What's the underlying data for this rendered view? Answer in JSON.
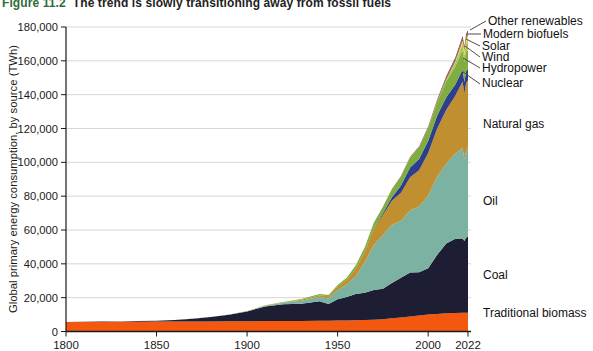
{
  "title": {
    "figure_label": "Figure 11.2",
    "figure_label_color": "#2F6B38",
    "text": "The trend is slowly transitioning away from fossil fuels"
  },
  "axes": {
    "y_label": "Global primary energy consumption, by source (TWh)",
    "y_ticks": [
      "0",
      "20,000",
      "40,000",
      "60,000",
      "80,000",
      "100,000",
      "120,000",
      "140,000",
      "160,000",
      "180,000"
    ],
    "x_ticks": [
      "1800",
      "1850",
      "1900",
      "1950",
      "2000",
      "2022"
    ]
  },
  "chart_data": {
    "type": "area",
    "stacked": true,
    "title": "",
    "xlabel": "",
    "ylabel": "Global primary energy consumption, by source (TWh)",
    "xlim": [
      1800,
      2022
    ],
    "ylim": [
      0,
      180000
    ],
    "grid": true,
    "legend_position": "right-direct-labels",
    "grid_color": "#d6d6d6",
    "axis_color": "#1a1a1a",
    "label_color": "#111111",
    "leader_color": "#4d4d4d",
    "x": [
      1800,
      1810,
      1820,
      1830,
      1840,
      1850,
      1860,
      1870,
      1880,
      1890,
      1900,
      1910,
      1920,
      1930,
      1940,
      1945,
      1950,
      1955,
      1960,
      1965,
      1970,
      1975,
      1980,
      1985,
      1990,
      1995,
      2000,
      2005,
      2010,
      2015,
      2019,
      2020,
      2021,
      2022
    ],
    "series": [
      {
        "name": "Traditional biomass",
        "color": "#F3580E",
        "values": [
          5556,
          5611,
          5667,
          5722,
          5778,
          5833,
          5889,
          5944,
          6000,
          6056,
          6111,
          6167,
          6222,
          6278,
          6333,
          6389,
          6444,
          6528,
          6611,
          6750,
          6944,
          7222,
          7778,
          8333,
          8889,
          9444,
          10000,
          10400,
          10800,
          11000,
          11050,
          11080,
          11100,
          11111
        ]
      },
      {
        "name": "Coal",
        "color": "#1D1D33",
        "values": [
          97,
          128,
          184,
          264,
          356,
          569,
          850,
          1642,
          2542,
          3856,
          5728,
          8656,
          9833,
          10125,
          11586,
          9800,
          12603,
          13900,
          15500,
          16151,
          17605,
          18056,
          20858,
          23422,
          25905,
          25561,
          27427,
          34930,
          41290,
          43786,
          43869,
          42339,
          44473,
          44854
        ]
      },
      {
        "name": "Oil",
        "color": "#7CB2A2",
        "values": [
          0,
          0,
          0,
          0,
          0,
          0,
          6,
          28,
          81,
          125,
          181,
          397,
          889,
          1756,
          2653,
          3300,
          5444,
          7300,
          10564,
          17984,
          26686,
          31633,
          34467,
          33586,
          36917,
          38950,
          42881,
          46210,
          47041,
          50382,
          53620,
          48712,
          51170,
          52970
        ]
      },
      {
        "name": "Natural gas",
        "color": "#C08F2F",
        "values": [
          0,
          0,
          0,
          0,
          0,
          0,
          0,
          0,
          11,
          36,
          64,
          140,
          244,
          603,
          875,
          1300,
          2092,
          2800,
          4472,
          6304,
          9614,
          11900,
          14237,
          16691,
          19484,
          21352,
          25167,
          28463,
          31954,
          34233,
          39292,
          38494,
          40375,
          39413
        ]
      },
      {
        "name": "Nuclear",
        "color": "#2C3E8C",
        "values": [
          0,
          0,
          0,
          0,
          0,
          0,
          0,
          0,
          0,
          0,
          0,
          0,
          0,
          0,
          0,
          0,
          0,
          0,
          8,
          72,
          224,
          1049,
          2020,
          4225,
          5676,
          6590,
          7323,
          7608,
          7374,
          6656,
          7073,
          6789,
          7031,
          6702
        ]
      },
      {
        "name": "Hydropower",
        "color": "#7FAE3E",
        "values": [
          0,
          0,
          0,
          0,
          0,
          0,
          0,
          2,
          5,
          9,
          47,
          119,
          247,
          431,
          661,
          780,
          891,
          1200,
          1900,
          2567,
          3141,
          3864,
          4708,
          5322,
          5897,
          6743,
          7368,
          8064,
          9518,
          10682,
          11294,
          11821,
          11183,
          11307
        ]
      },
      {
        "name": "Wind",
        "color": "#A9C74F",
        "values": [
          0,
          0,
          0,
          0,
          0,
          0,
          0,
          0,
          0,
          0,
          0,
          0,
          0,
          0,
          0,
          0,
          0,
          0,
          0,
          0,
          0,
          0,
          0,
          0,
          10,
          22,
          88,
          282,
          959,
          2273,
          3832,
          4357,
          4872,
          5488
        ]
      },
      {
        "name": "Solar",
        "color": "#EDD64A",
        "values": [
          0,
          0,
          0,
          0,
          0,
          0,
          0,
          0,
          0,
          0,
          0,
          0,
          0,
          0,
          0,
          0,
          0,
          0,
          0,
          0,
          0,
          0,
          0,
          0,
          0,
          1,
          3,
          11,
          93,
          666,
          1857,
          2322,
          2891,
          3448
        ]
      },
      {
        "name": "Modern biofuels",
        "color": "#8E5A63",
        "values": [
          0,
          0,
          0,
          0,
          0,
          0,
          0,
          0,
          0,
          0,
          0,
          0,
          0,
          0,
          0,
          0,
          0,
          0,
          0,
          0,
          0,
          0,
          47,
          112,
          170,
          222,
          263,
          461,
          1032,
          1167,
          1290,
          1204,
          1290,
          1370
        ]
      },
      {
        "name": "Other renewables",
        "color": "#843B3B",
        "values": [
          0,
          0,
          0,
          0,
          0,
          0,
          0,
          0,
          0,
          0,
          0,
          0,
          0,
          0,
          0,
          0,
          0,
          0,
          0,
          14,
          30,
          50,
          104,
          206,
          324,
          428,
          601,
          712,
          905,
          1158,
          1430,
          1501,
          1568,
          1607
        ]
      }
    ]
  }
}
